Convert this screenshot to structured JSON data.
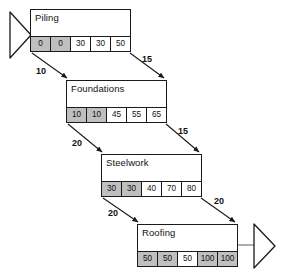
{
  "diagram": {
    "type": "precedence-network",
    "nodes": [
      {
        "id": "piling",
        "label": "Piling",
        "x": 30,
        "y": 9,
        "width": 101,
        "height": 43,
        "cells": [
          {
            "value": "0",
            "shaded": true
          },
          {
            "value": "0",
            "shaded": true
          },
          {
            "value": "30",
            "shaded": false
          },
          {
            "value": "30",
            "shaded": false
          },
          {
            "value": "50",
            "shaded": false
          }
        ]
      },
      {
        "id": "foundations",
        "label": "Foundations",
        "x": 66,
        "y": 80,
        "width": 101,
        "height": 43,
        "cells": [
          {
            "value": "10",
            "shaded": true
          },
          {
            "value": "10",
            "shaded": true
          },
          {
            "value": "45",
            "shaded": false
          },
          {
            "value": "55",
            "shaded": false
          },
          {
            "value": "65",
            "shaded": false
          }
        ]
      },
      {
        "id": "steelwork",
        "label": "Steelwork",
        "x": 101,
        "y": 154,
        "width": 101,
        "height": 43,
        "cells": [
          {
            "value": "30",
            "shaded": true
          },
          {
            "value": "30",
            "shaded": true
          },
          {
            "value": "40",
            "shaded": false
          },
          {
            "value": "70",
            "shaded": false
          },
          {
            "value": "80",
            "shaded": false
          }
        ]
      },
      {
        "id": "roofing",
        "label": "Roofing",
        "x": 137,
        "y": 224,
        "width": 101,
        "height": 43,
        "cells": [
          {
            "value": "50",
            "shaded": true
          },
          {
            "value": "50",
            "shaded": true
          },
          {
            "value": "50",
            "shaded": false
          },
          {
            "value": "100",
            "shaded": true
          },
          {
            "value": "100",
            "shaded": true
          }
        ]
      }
    ],
    "edges": [
      {
        "id": "piling-to-foundations-left",
        "label": "10",
        "from": "piling",
        "to": "foundations",
        "label_x": 36,
        "label_y": 66
      },
      {
        "id": "piling-to-foundations-right",
        "label": "15",
        "from": "piling",
        "to": "foundations",
        "label_x": 142,
        "label_y": 54
      },
      {
        "id": "foundations-to-steelwork-left",
        "label": "20",
        "from": "foundations",
        "to": "steelwork",
        "label_x": 72,
        "label_y": 138
      },
      {
        "id": "foundations-to-steelwork-right",
        "label": "15",
        "from": "foundations",
        "to": "steelwork",
        "label_x": 178,
        "label_y": 126
      },
      {
        "id": "steelwork-to-roofing-left",
        "label": "20",
        "from": "steelwork",
        "to": "roofing",
        "label_x": 108,
        "label_y": 208
      },
      {
        "id": "steelwork-to-roofing-right",
        "label": "20",
        "from": "steelwork",
        "to": "roofing",
        "label_x": 214,
        "label_y": 196
      }
    ],
    "terminators": [
      {
        "id": "start-marker",
        "shape": "triangle-right",
        "x": 8,
        "y": 12
      },
      {
        "id": "end-marker",
        "shape": "triangle-right",
        "x": 252,
        "y": 226
      }
    ],
    "colors": {
      "line": "#1a1a1a",
      "shaded_cell": "#bfbfbf",
      "white_cell": "#ffffff",
      "text": "#111111",
      "background": "#ffffff"
    }
  }
}
